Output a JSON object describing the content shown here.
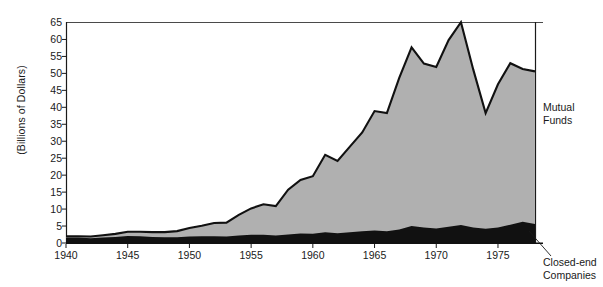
{
  "chart_data": {
    "type": "area",
    "title": "",
    "subtitle": "",
    "xlabel": "",
    "ylabel": "(Billions of Dollars)",
    "xlim": [
      1940,
      1978
    ],
    "ylim": [
      0,
      65
    ],
    "grid": false,
    "stacked": true,
    "legend_position": "right-inline-annotations",
    "xticks": [
      1940,
      1945,
      1950,
      1955,
      1960,
      1965,
      1970,
      1975
    ],
    "xtick_labels": [
      "1940",
      "1945",
      "1950",
      "1955",
      "1960",
      "1965",
      "1970",
      "1975"
    ],
    "yticks": [
      0,
      5,
      10,
      15,
      20,
      25,
      30,
      35,
      40,
      45,
      50,
      55,
      60,
      65
    ],
    "ytick_labels": [
      "0",
      "5",
      "10",
      "15",
      "20",
      "25",
      "30",
      "35",
      "40",
      "45",
      "50",
      "55",
      "60",
      "65"
    ],
    "x": [
      1940,
      1941,
      1942,
      1943,
      1944,
      1945,
      1946,
      1947,
      1948,
      1949,
      1950,
      1951,
      1952,
      1953,
      1954,
      1955,
      1956,
      1957,
      1958,
      1959,
      1960,
      1961,
      1962,
      1963,
      1964,
      1965,
      1966,
      1967,
      1968,
      1969,
      1970,
      1971,
      1972,
      1973,
      1974,
      1975,
      1976,
      1977,
      1978
    ],
    "series": [
      {
        "name": "Closed-end Companies",
        "color": "#111111",
        "values": [
          1.6,
          1.6,
          1.4,
          1.6,
          1.8,
          2.1,
          2.0,
          1.8,
          1.7,
          1.7,
          1.9,
          2.0,
          2.0,
          1.9,
          2.2,
          2.4,
          2.4,
          2.2,
          2.5,
          2.8,
          2.7,
          3.2,
          2.9,
          3.2,
          3.5,
          3.7,
          3.5,
          4.0,
          5.0,
          4.6,
          4.3,
          4.8,
          5.3,
          4.6,
          4.2,
          4.6,
          5.4,
          6.3,
          5.6
        ]
      },
      {
        "name": "Mutual Funds",
        "color": "#b0b0b0",
        "values": [
          0.4,
          0.4,
          0.5,
          0.7,
          0.9,
          1.2,
          1.3,
          1.4,
          1.5,
          1.8,
          2.5,
          3.1,
          3.9,
          4.1,
          6.1,
          7.8,
          9.0,
          8.7,
          13.2,
          15.8,
          17.0,
          22.8,
          21.3,
          25.2,
          29.1,
          35.2,
          34.8,
          44.7,
          52.7,
          48.3,
          47.6,
          55.0,
          59.8,
          46.5,
          34.1,
          42.2,
          47.6,
          45.0,
          45.0
        ]
      }
    ],
    "stack_totals": [
      2.0,
      2.0,
      1.9,
      2.3,
      2.7,
      3.3,
      3.3,
      3.2,
      3.2,
      3.5,
      4.4,
      5.1,
      5.9,
      6.0,
      8.3,
      10.2,
      11.4,
      10.9,
      15.7,
      18.6,
      19.7,
      26.0,
      24.2,
      28.4,
      32.6,
      38.9,
      38.3,
      48.7,
      57.7,
      52.9,
      51.9,
      59.8,
      65.1,
      51.1,
      38.3,
      46.8,
      53.0,
      51.3,
      50.6
    ],
    "annotations": [
      {
        "name": "mutual-funds",
        "text_line1": "Mutual",
        "text_line2": "Funds"
      },
      {
        "name": "closed-end",
        "text_line1": "Closed-end",
        "text_line2": "Companies"
      }
    ]
  },
  "axis": {
    "ylabel": "(Billions of Dollars)"
  }
}
